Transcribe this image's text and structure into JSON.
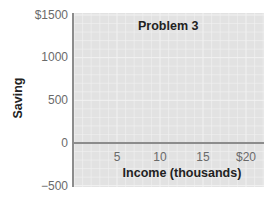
{
  "chart_data": {
    "type": "line",
    "title": "Problem 3",
    "xlabel": "Income (thousands)",
    "ylabel": "Saving",
    "x_ticks": [
      5,
      10,
      15,
      20
    ],
    "x_tick_labels": [
      "5",
      "10",
      "15",
      "$20"
    ],
    "y_ticks": [
      1500,
      1000,
      500,
      0,
      -500
    ],
    "y_tick_labels": [
      "$1500",
      "1000",
      "500",
      "0",
      "−500"
    ],
    "xlim": [
      0,
      22
    ],
    "ylim": [
      -500,
      1500
    ],
    "grid": true,
    "legend": null,
    "series": [],
    "colors": {
      "plot_bg": "#e2e2e2",
      "grid": "#f2f2f2",
      "axis": "#8c8c8c",
      "zero_line": "#8c8c8c"
    }
  }
}
